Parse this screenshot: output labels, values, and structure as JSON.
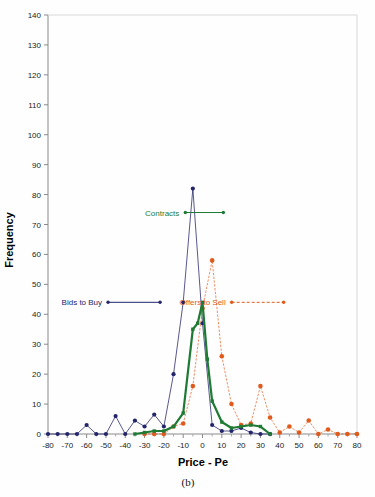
{
  "figure": {
    "caption": "(b)",
    "xlabel": "Price - Pe",
    "ylabel": "Frequency"
  },
  "annotations": {
    "contracts": "Contracts",
    "bids": "Bids to Buy",
    "offers": "Offers to Sell"
  },
  "colors": {
    "contracts": "#1f7a34",
    "bids": "#23256b",
    "offers": "#e05a1c",
    "axis": "#8a8a8a",
    "text": "#222222"
  },
  "chart_data": {
    "type": "line",
    "title": "",
    "xlabel": "Price - Pe",
    "ylabel": "Frequency",
    "xlim": [
      -80,
      80
    ],
    "ylim": [
      0,
      140
    ],
    "xticks": [
      -80,
      -70,
      -60,
      -50,
      -40,
      -30,
      -20,
      -10,
      0,
      10,
      20,
      30,
      40,
      50,
      60,
      70,
      80
    ],
    "yticks": [
      0,
      10,
      20,
      30,
      40,
      50,
      60,
      70,
      80,
      90,
      100,
      110,
      120,
      130,
      140
    ],
    "xtick_labels": [
      "-80",
      "-70",
      "-60",
      "-50",
      "-40",
      "-30",
      "-20",
      "-10",
      "0",
      "10",
      "20",
      "30",
      "40",
      "50",
      "60",
      "70",
      "80"
    ],
    "ytick_labels": [
      "0",
      "10",
      "20",
      "30",
      "40",
      "50",
      "60",
      "70",
      "80",
      "90",
      "100",
      "110",
      "120",
      "130",
      "140"
    ],
    "grid": false,
    "legend_position": "inline-annotations",
    "series": [
      {
        "name": "Bids to Buy",
        "color": "#23256b",
        "style": "solid",
        "marker": "filled-circle",
        "x": [
          -80,
          -75,
          -70,
          -65,
          -60,
          -55,
          -50,
          -45,
          -40,
          -35,
          -30,
          -25,
          -20,
          -15,
          -10,
          -5,
          0,
          5,
          10,
          15,
          20,
          25,
          30,
          35
        ],
        "y": [
          0,
          0,
          0,
          0,
          3,
          0,
          0,
          6,
          0,
          4.5,
          2.5,
          6.5,
          2.5,
          20,
          44,
          82,
          37,
          3,
          1,
          1,
          2,
          0.5,
          0,
          0
        ]
      },
      {
        "name": "Offers to Sell",
        "color": "#e05a1c",
        "style": "dotted",
        "marker": "filled-circle",
        "x": [
          -30,
          -25,
          -20,
          -15,
          -10,
          -5,
          0,
          5,
          10,
          15,
          20,
          25,
          30,
          35,
          40,
          45,
          50,
          55,
          60,
          65,
          70,
          75,
          80
        ],
        "y": [
          0,
          0,
          0,
          2.5,
          3.5,
          16,
          42,
          58,
          26,
          10,
          3,
          3.5,
          16,
          5.5,
          0.5,
          2.5,
          0.5,
          4.5,
          0,
          1.5,
          0,
          0,
          0
        ]
      },
      {
        "name": "Contracts",
        "color": "#1f7a34",
        "style": "solid-thick",
        "marker": "filled-square",
        "x": [
          -35,
          -30,
          -25,
          -20,
          -15,
          -10,
          -5,
          -2.5,
          0,
          2.5,
          5,
          10,
          15,
          20,
          25,
          30,
          35
        ],
        "y": [
          0,
          0.5,
          1,
          1,
          2.5,
          7,
          35,
          37,
          44,
          25,
          11,
          4,
          2,
          2.5,
          3,
          2.5,
          0
        ]
      }
    ],
    "annotations": [
      {
        "text": "Contracts",
        "x": -12,
        "y": 74,
        "color": "#1f7a34"
      },
      {
        "text": "Bids to Buy",
        "x": -52,
        "y": 44,
        "color": "#23256b"
      },
      {
        "text": "Offers to Sell",
        "x": 12,
        "y": 44,
        "color": "#e05a1c"
      }
    ]
  }
}
